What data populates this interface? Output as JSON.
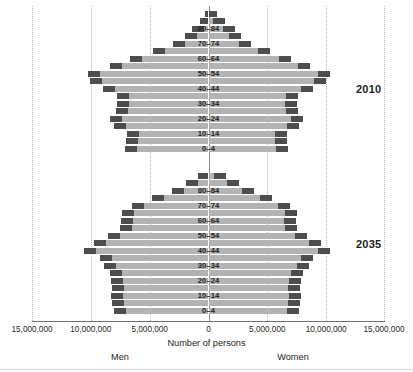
{
  "chart_data": {
    "type": "bar",
    "chart_variant": "population-pyramid",
    "title": "",
    "xlabel": "Number of persons",
    "ylabel": "",
    "xlim": [
      -15000000,
      15000000
    ],
    "grid": true,
    "legend_position": "none",
    "axis_ticks": [
      {
        "value": -15000000,
        "label": "15,000,000"
      },
      {
        "value": -10000000,
        "label": "10,000,000"
      },
      {
        "value": -5000000,
        "label": "5,000,000"
      },
      {
        "value": 0,
        "label": "0"
      },
      {
        "value": 5000000,
        "label": "5,000,000"
      },
      {
        "value": 10000000,
        "label": "10,000,000"
      },
      {
        "value": 15000000,
        "label": "15,000,000"
      }
    ],
    "side_labels": {
      "left": "Men",
      "right": "Women"
    },
    "age_groups": [
      "0-4",
      "5-9",
      "10-14",
      "15-19",
      "20-24",
      "25-29",
      "30-34",
      "35-39",
      "40-44",
      "45-49",
      "50-54",
      "55-59",
      "60-64",
      "65-69",
      "70-74",
      "75-79",
      "80-84",
      "85-89",
      "90+"
    ],
    "age_labels_shown": [
      "0-4",
      "10-14",
      "20-24",
      "30-34",
      "40-44",
      "50-54",
      "60-64",
      "70-74",
      "80-84"
    ],
    "panels": [
      {
        "name": "2010",
        "year_label": "2010",
        "series": [
          {
            "name": "Men",
            "side": "left",
            "values": [
              7100000,
              7000000,
              6950000,
              8050000,
              8400000,
              7900000,
              7750000,
              7750000,
              9000000,
              10050000,
              10250000,
              8400000,
              6700000,
              4700000,
              3000000,
              2000000,
              1400000,
              700000,
              300000
            ]
          },
          {
            "name": "Women",
            "side": "right",
            "values": [
              6750000,
              6700000,
              6650000,
              7700000,
              8050000,
              7600000,
              7500000,
              7600000,
              8900000,
              10000000,
              10300000,
              8600000,
              7050000,
              5200000,
              3600000,
              2800000,
              2250000,
              1400000,
              750000
            ]
          }
        ]
      },
      {
        "name": "2035",
        "year_label": "2035",
        "series": [
          {
            "name": "Men",
            "side": "left",
            "values": [
              8050000,
              8200000,
              8250000,
              8200000,
              8300000,
              8400000,
              8900000,
              9200000,
              10600000,
              9750000,
              8500000,
              7550000,
              7400000,
              7350000,
              6500000,
              4800000,
              3100000,
              1900000,
              900000
            ]
          },
          {
            "name": "Women",
            "side": "right",
            "values": [
              7700000,
              7800000,
              7850000,
              7800000,
              7900000,
              8000000,
              8550000,
              8900000,
              10350000,
              9550000,
              8400000,
              7500000,
              7450000,
              7550000,
              6900000,
              5400000,
              3850000,
              2600000,
              1500000
            ]
          }
        ]
      }
    ],
    "colors": {
      "bar_fill": "#b3b3b3",
      "bar_cap": "#4d4d4d",
      "gridline": "#b9b9b9",
      "axis": "#6f6f6f",
      "text": "#231f20"
    }
  }
}
